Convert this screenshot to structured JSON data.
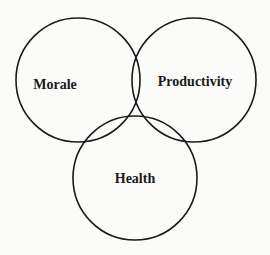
{
  "diagram": {
    "type": "venn",
    "sets": [
      {
        "id": "morale",
        "label": "Morale",
        "cx": 78,
        "cy": 80,
        "r": 62,
        "label_x": 55,
        "label_y": 86
      },
      {
        "id": "productivity",
        "label": "Productivity",
        "cx": 194,
        "cy": 80,
        "r": 62,
        "label_x": 195,
        "label_y": 83
      },
      {
        "id": "health",
        "label": "Health",
        "cx": 135,
        "cy": 178,
        "r": 62,
        "label_x": 135,
        "label_y": 180
      }
    ],
    "stroke_color": "#1a1a1a",
    "background_color": "#fbfbfa"
  }
}
